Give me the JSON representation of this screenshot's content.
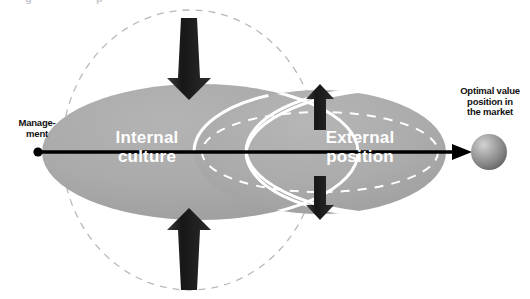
{
  "canvas": {
    "width": 530,
    "height": 299,
    "background": "#ffffff"
  },
  "colors": {
    "ellipse_fill": "#a8a8a8",
    "ellipse_fill_light": "#b2b2b2",
    "dashed_circle_stroke": "#b9b9b9",
    "white_outline": "#ffffff",
    "arrow_dark": "#1a1a1a",
    "axis_line": "#000000",
    "sphere_light": "#cfcfcf",
    "sphere_dark": "#6e6e6e",
    "label_text_dark": "#111111",
    "label_text_light": "#ffffff"
  },
  "labels": {
    "management": "Manage-\nment",
    "optimal": "Optimal value\nposition in\nthe market",
    "internal": "Internal\nculture",
    "external": "External\nposition"
  },
  "top_artifact": {
    "a": "g",
    "b": "p"
  },
  "shapes": {
    "left_ellipse": {
      "cx": 200,
      "cy": 152,
      "rx": 158,
      "ry": 68,
      "name": "internal-culture-ellipse"
    },
    "right_ellipse": {
      "cx": 320,
      "cy": 152,
      "rx": 126,
      "ry": 62,
      "name": "external-position-ellipse"
    },
    "dashed_circle": {
      "cx": 190,
      "cy": 150,
      "rx": 128,
      "ry": 140,
      "name": "management-scope-dashed-circle"
    },
    "overlap_left_outline": {
      "cx": 200,
      "cy": 152,
      "rx": 158,
      "ry": 68
    },
    "overlap_right_outline": {
      "cx": 320,
      "cy": 152,
      "rx": 126,
      "ry": 62
    },
    "inner_dashed_ellipse": {
      "cx": 320,
      "cy": 152,
      "rx": 118,
      "ry": 40,
      "name": "external-inner-dashed-ellipse"
    },
    "sphere": {
      "cx": 489,
      "cy": 152,
      "r": 18,
      "name": "optimal-value-sphere"
    },
    "axis": {
      "x1": 37,
      "y1": 152,
      "x2": 470,
      "y2": 152,
      "name": "management-axis-arrow"
    },
    "axis_dot": {
      "cx": 38,
      "cy": 152,
      "r": 4
    }
  },
  "arrows": {
    "top_large": {
      "x": 189,
      "y_start": 18,
      "y_end": 98,
      "direction": "down",
      "name": "top-pressure-arrow"
    },
    "bottom_large": {
      "x": 189,
      "y_start": 288,
      "y_end": 208,
      "direction": "up",
      "name": "bottom-pressure-arrow"
    },
    "right_up_small": {
      "x": 320,
      "y_start": 130,
      "y_end": 85,
      "direction": "up",
      "name": "right-up-arrow"
    },
    "right_down_small": {
      "x": 320,
      "y_start": 175,
      "y_end": 218,
      "direction": "down",
      "name": "right-down-arrow"
    }
  }
}
